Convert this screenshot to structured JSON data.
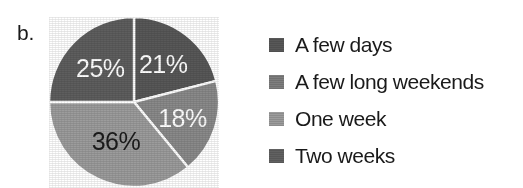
{
  "panel": {
    "label": "b."
  },
  "colors": {
    "slice_a_few_days": "#585858",
    "slice_a_few_long_weekends": "#8a8a8a",
    "slice_one_week": "#9c9c9c",
    "slice_two_weeks": "#5e5e5e",
    "separator": "#ffffff",
    "label_light": "#ffffff",
    "label_dark": "#1c1c1c",
    "background": "#ffffff"
  },
  "legend": {
    "items": [
      {
        "label": "A few days",
        "swatch": "#585858"
      },
      {
        "label": "A few long weekends",
        "swatch": "#7e7e7e"
      },
      {
        "label": "One week",
        "swatch": "#9c9c9c"
      },
      {
        "label": "Two weeks",
        "swatch": "#616161"
      }
    ]
  },
  "chart_data": {
    "type": "pie",
    "title": "",
    "categories": [
      "A few days",
      "A few long weekends",
      "One week",
      "Two weeks"
    ],
    "values": [
      21,
      18,
      36,
      25
    ],
    "value_labels": [
      "21%",
      "18%",
      "36%",
      "25%"
    ],
    "unit": "percent",
    "start_angle_deg": 0,
    "direction": "clockwise",
    "legend_position": "right",
    "slice_colors": [
      "#585858",
      "#8a8a8a",
      "#9c9c9c",
      "#5e5e5e"
    ],
    "label_text_colors": [
      "#ffffff",
      "#ffffff",
      "#1c1c1c",
      "#ffffff"
    ],
    "grid": false
  }
}
